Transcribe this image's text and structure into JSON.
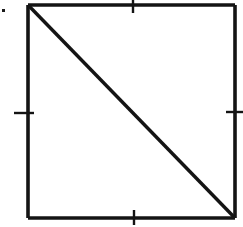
{
  "figure": {
    "background_color": "#ffffff",
    "ink_color": "#141414",
    "canvas": {
      "width": 243,
      "height": 227
    },
    "square": {
      "name": "square-outline",
      "left": 28,
      "top": 5,
      "right": 235,
      "bottom": 218,
      "width": 207,
      "height": 213,
      "stroke_width": 3.6,
      "sides": [
        {
          "name": "top-side",
          "x1": 28,
          "y1": 5,
          "x2": 235,
          "y2": 5
        },
        {
          "name": "right-side",
          "x1": 235,
          "y1": 5,
          "x2": 235,
          "y2": 218
        },
        {
          "name": "bottom-side",
          "x1": 235,
          "y1": 218,
          "x2": 28,
          "y2": 218
        },
        {
          "name": "left-side",
          "x1": 28,
          "y1": 218,
          "x2": 28,
          "y2": 5
        }
      ]
    },
    "diagonal": {
      "name": "diagonal-line",
      "from_corner": "top-left",
      "to_corner": "bottom-right",
      "x1": 29,
      "y1": 6,
      "x2": 234,
      "y2": 217,
      "stroke_width": 3.4
    },
    "ticks": [
      {
        "name": "top-midpoint-tick",
        "side": "top",
        "orientation": "vertical",
        "x1": 133,
        "y1": 0,
        "x2": 133,
        "y2": 13,
        "stroke_width": 2.4
      },
      {
        "name": "left-midpoint-tick",
        "side": "left",
        "orientation": "horizontal",
        "x1": 14,
        "y1": 113,
        "x2": 34,
        "y2": 113,
        "stroke_width": 2.4
      },
      {
        "name": "right-midpoint-tick",
        "side": "right",
        "orientation": "horizontal",
        "x1": 226,
        "y1": 112,
        "x2": 243,
        "y2": 112,
        "stroke_width": 2.4
      },
      {
        "name": "bottom-midpoint-tick",
        "side": "bottom",
        "orientation": "vertical",
        "x1": 134,
        "y1": 210,
        "x2": 134,
        "y2": 225,
        "stroke_width": 2.4
      }
    ],
    "speck": {
      "name": "scan-speck",
      "x": 2,
      "y": 9,
      "width": 3,
      "height": 3
    }
  }
}
